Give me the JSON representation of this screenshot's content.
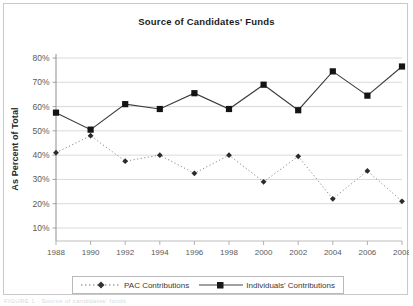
{
  "chart": {
    "title": "Source of Candidates' Funds",
    "ylabel": "As Percent of Total",
    "xlabel": ""
  },
  "legend": {
    "items": [
      {
        "label": "PAC Contributions",
        "marker": "diamond-marker",
        "line": "dotted"
      },
      {
        "label": "Individuals' Contributions",
        "marker": "square-marker",
        "line": "solid"
      }
    ]
  },
  "footer": {
    "artifact_text": "FIGURE 1 · Source of candidates' funds"
  },
  "chart_data": {
    "type": "line",
    "title": "Source of Candidates' Funds",
    "xlabel": "",
    "ylabel": "As Percent of Total",
    "x": [
      1988,
      1990,
      1992,
      1994,
      1996,
      1998,
      2000,
      2002,
      2004,
      2006,
      2008
    ],
    "xtick_labels": [
      "1988",
      "1990",
      "1992",
      "1994",
      "1996",
      "1998",
      "2000",
      "2002",
      "2004",
      "2006",
      "2008"
    ],
    "ylim": [
      10,
      80
    ],
    "ytick_labels": [
      "10%",
      "20%",
      "30%",
      "40%",
      "50%",
      "60%",
      "70%",
      "80%"
    ],
    "ytick_values": [
      10,
      20,
      30,
      40,
      50,
      60,
      70,
      80
    ],
    "grid": true,
    "grid_axis": "y",
    "legend_position": "bottom",
    "series": [
      {
        "name": "PAC Contributions",
        "marker": "diamond",
        "linestyle": "dotted",
        "color": "#555555",
        "values": [
          41,
          48,
          37.5,
          40,
          32.5,
          40,
          29,
          39.5,
          22,
          33.5,
          21
        ]
      },
      {
        "name": "Individuals' Contributions",
        "marker": "square",
        "linestyle": "solid",
        "color": "#1a1a1a",
        "values": [
          57.5,
          50.5,
          61,
          59,
          65.5,
          59,
          69,
          58.5,
          74.5,
          64.5,
          76.5
        ]
      }
    ]
  }
}
